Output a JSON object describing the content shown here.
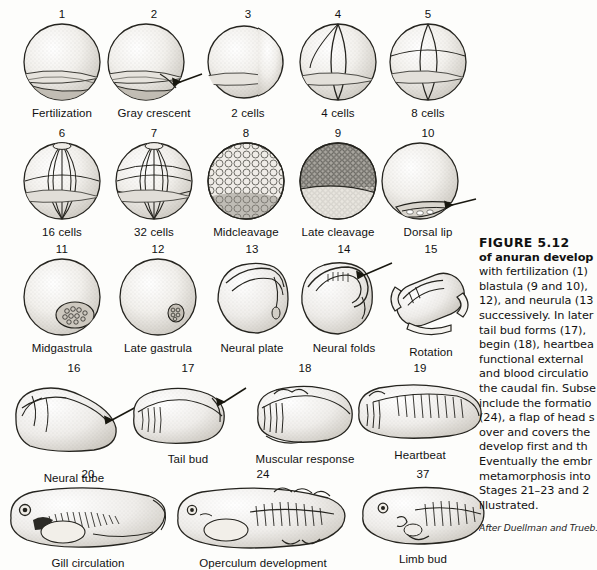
{
  "figure": {
    "title_prefix": "FIGURE 5.12",
    "rows": [
      {
        "name": "cleavage-row-1",
        "top": 8,
        "stages": [
          {
            "num": "1",
            "label": "Fertilization",
            "art": "sphere-plain",
            "x": 16,
            "w": 92
          },
          {
            "num": "2",
            "label": "Gray crescent",
            "art": "sphere-crescent",
            "x": 108,
            "w": 92
          },
          {
            "num": "3",
            "label": "2 cells",
            "art": "sphere-2cell",
            "x": 204,
            "w": 88
          },
          {
            "num": "4",
            "label": "4 cells",
            "art": "sphere-4cell",
            "x": 294,
            "w": 88
          },
          {
            "num": "5",
            "label": "8 cells",
            "art": "sphere-8cell",
            "x": 384,
            "w": 88
          }
        ]
      },
      {
        "name": "cleavage-row-2",
        "top": 127,
        "stages": [
          {
            "num": "6",
            "label": "16 cells",
            "art": "sphere-16cell",
            "x": 16,
            "w": 92
          },
          {
            "num": "7",
            "label": "32 cells",
            "art": "sphere-32cell",
            "x": 108,
            "w": 92
          },
          {
            "num": "8",
            "label": "Midcleavage",
            "art": "sphere-midcleav",
            "x": 200,
            "w": 92
          },
          {
            "num": "9",
            "label": "Late cleavage",
            "art": "sphere-latecleav",
            "x": 292,
            "w": 92
          },
          {
            "num": "10",
            "label": "Dorsal lip",
            "art": "sphere-dorsallip",
            "x": 384,
            "w": 88
          }
        ]
      },
      {
        "name": "gastrula-neurula-row",
        "top": 243,
        "stages": [
          {
            "num": "11",
            "label": "Midgastrula",
            "art": "sphere-midgast",
            "x": 14,
            "w": 96
          },
          {
            "num": "12",
            "label": "Late gastrula",
            "art": "sphere-lategast",
            "x": 110,
            "w": 96
          },
          {
            "num": "13",
            "label": "Neural plate",
            "art": "neural-plate",
            "x": 206,
            "w": 92
          },
          {
            "num": "14",
            "label": "Neural folds",
            "art": "neural-folds",
            "x": 298,
            "w": 92
          },
          {
            "num": "15",
            "label": "Rotation",
            "art": "rotation",
            "x": 390,
            "w": 82
          }
        ]
      },
      {
        "name": "embryo-row",
        "top": 362,
        "stages": [
          {
            "num": "16",
            "label": "Neural tube",
            "art": "neural-tube",
            "x": 14,
            "w": 120,
            "label_drop": 16
          },
          {
            "num": "17",
            "label": "Tail bud",
            "art": "tail-bud",
            "x": 134,
            "w": 108
          },
          {
            "num": "18",
            "label": "Muscular response",
            "art": "muscular",
            "x": 242,
            "w": 126
          },
          {
            "num": "19",
            "label": "Heartbeat",
            "art": "heartbeat",
            "x": 368,
            "w": 104
          }
        ]
      },
      {
        "name": "larva-row",
        "top": 468,
        "stages": [
          {
            "num": "20",
            "label": "Gill circulation",
            "art": "gill-larva",
            "x": 8,
            "w": 160
          },
          {
            "num": "24",
            "label": "Operculum development",
            "art": "operculum-larva",
            "x": 168,
            "w": 190
          },
          {
            "num": "37",
            "label": "Limb bud",
            "art": "limbbud-larva",
            "x": 358,
            "w": 130
          }
        ]
      }
    ],
    "caption_lines": [
      {
        "text": "FIGURE 5.12",
        "style": "head"
      },
      {
        "text": "of anuran develop",
        "style": "bold"
      },
      {
        "text": "with fertilization (1)",
        "style": "normal"
      },
      {
        "text": "blastula (9 and 10),",
        "style": "normal"
      },
      {
        "text": "12), and neurula (13",
        "style": "normal"
      },
      {
        "text": "successively. In later",
        "style": "normal"
      },
      {
        "text": "tail bud forms (17),",
        "style": "normal"
      },
      {
        "text": "begin (18), heartbea",
        "style": "normal"
      },
      {
        "text": "functional external",
        "style": "normal"
      },
      {
        "text": "and blood circulatio",
        "style": "normal"
      },
      {
        "text": "the caudal fin. Subse",
        "style": "normal"
      },
      {
        "text": "include the formatio",
        "style": "normal"
      },
      {
        "text": "(24), a flap of head s",
        "style": "normal"
      },
      {
        "text": "over and covers the",
        "style": "normal"
      },
      {
        "text": "develop first and th",
        "style": "normal"
      },
      {
        "text": "Eventually the embr",
        "style": "normal"
      },
      {
        "text": "metamorphosis into",
        "style": "normal"
      },
      {
        "text": "Stages 21–23 and 2",
        "style": "normal"
      },
      {
        "text": "illustrated.",
        "style": "normal"
      }
    ],
    "credit": "After Duellman and Trueb."
  }
}
